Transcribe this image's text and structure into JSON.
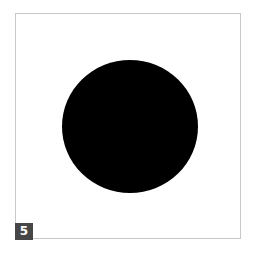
{
  "figure": {
    "shape": "circle",
    "fill_color": "#000000",
    "frame_border_color": "#c8c8c8"
  },
  "badge": {
    "label": "5",
    "background_color": "#474747"
  }
}
